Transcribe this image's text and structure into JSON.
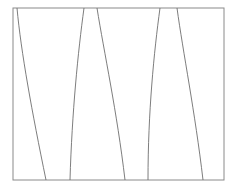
{
  "figure": {
    "title": "",
    "background_color": "#ffffff",
    "width": 237,
    "height": 188,
    "frame": {
      "name": "plot-frame",
      "x": 13,
      "y": 8,
      "width": 211,
      "height": 172,
      "stroke_color": "#8a8a8a",
      "stroke_width": 1,
      "fill": "none"
    },
    "line_style": {
      "stroke_color": "#6e6e6e",
      "stroke_width": 0.9
    },
    "curves": [
      {
        "name": "curve-1",
        "label": "",
        "top_x": 17,
        "bottom_x": 46,
        "path": "M 17 8 C 21 52, 32 112, 46 180"
      },
      {
        "name": "curve-2",
        "label": "",
        "top_x": 84,
        "bottom_x": 70,
        "path": "M 84 8 C 78 52, 72 112, 70 180"
      },
      {
        "name": "curve-3",
        "label": "",
        "top_x": 97,
        "bottom_x": 125,
        "path": "M 97 8 C 104 52, 117 112, 125 180"
      },
      {
        "name": "curve-4",
        "label": "",
        "top_x": 160,
        "bottom_x": 148,
        "path": "M 160 8 C 154 52, 148 112, 148 180"
      },
      {
        "name": "curve-5",
        "label": "",
        "top_x": 177,
        "bottom_x": 203,
        "path": "M 177 8 C 183 52, 195 112, 203 180"
      }
    ]
  }
}
